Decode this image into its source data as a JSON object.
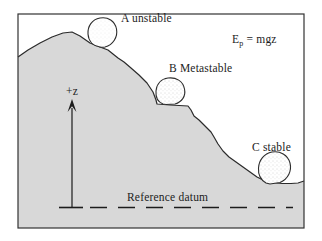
{
  "diagram": {
    "labels": {
      "boulder_a": "A unstable",
      "boulder_b": "B Metastable",
      "boulder_c": "C stable",
      "z_axis": "+z",
      "reference_datum": "Reference datum"
    },
    "equation": {
      "base": "E",
      "subscript": "p",
      "rest": " = mgz"
    },
    "icons": {
      "z_axis_arrow": "up-arrow"
    },
    "colors": {
      "hill_fill": "#d8d8d8",
      "outline": "#2b2b2b",
      "background": "#ffffff",
      "text": "#1c1c1c"
    }
  }
}
